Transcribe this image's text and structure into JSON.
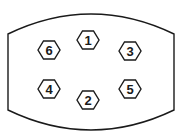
{
  "diagram": {
    "type": "bolt-tightening-sequence",
    "outline_color": "#1a1a1a",
    "bolts": [
      {
        "label": "1",
        "cx": 88,
        "cy": 40
      },
      {
        "label": "2",
        "cx": 88,
        "cy": 100
      },
      {
        "label": "3",
        "cx": 130,
        "cy": 51
      },
      {
        "label": "4",
        "cx": 49,
        "cy": 89
      },
      {
        "label": "5",
        "cx": 130,
        "cy": 89
      },
      {
        "label": "6",
        "cx": 49,
        "cy": 50
      }
    ]
  }
}
